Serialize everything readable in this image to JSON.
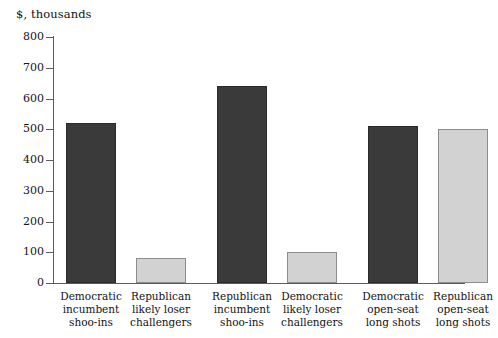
{
  "chart_data": {
    "type": "bar",
    "title": "$, thousands",
    "xlabel": "",
    "ylabel": "",
    "ylim": [
      0,
      800
    ],
    "yticks": [
      0,
      100,
      200,
      300,
      400,
      500,
      600,
      700,
      800
    ],
    "grid": false,
    "legend": "none",
    "categories": [
      "Democratic\nincumbent\nshoo-ins",
      "Republican\nlikely loser\nchallengers",
      "Republican\nincumbent\nshoo-ins",
      "Democratic\nlikely loser\nchallengers",
      "Democratic\nopen-seat\nlong shots",
      "Republican\nopen-seat\nlong shots"
    ],
    "values": [
      520,
      80,
      640,
      100,
      510,
      500
    ],
    "bar_colors": [
      "dark",
      "light",
      "dark",
      "light",
      "dark",
      "light"
    ],
    "colors": {
      "dark": "#3a3a3a",
      "light": "#d2d2d2",
      "axis": "#5c5c5c",
      "text": "#131313",
      "background": "#ffffff"
    }
  },
  "axis": {
    "tick_labels": [
      "800",
      "700",
      "600",
      "500",
      "400",
      "300",
      "200",
      "100",
      "0"
    ]
  }
}
